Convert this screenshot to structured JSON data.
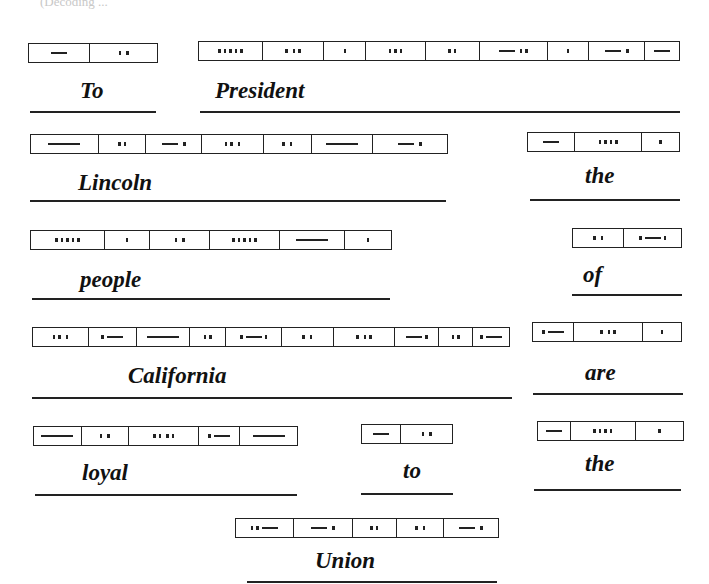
{
  "header_fragment": "(Decoding ...",
  "groups": [
    {
      "word": "To",
      "box": {
        "x": 28,
        "y": 43,
        "w": 130
      },
      "cells": [
        {
          "w": 62,
          "code": "L"
        },
        {
          "w": 68,
          "code": "d d"
        }
      ],
      "label": {
        "x": 80,
        "y": 78
      },
      "rule": {
        "x": 30,
        "y": 111,
        "w": 126
      }
    },
    {
      "word": "President",
      "box": {
        "x": 198,
        "y": 41,
        "w": 482
      },
      "cells": [
        {
          "w": 64,
          "code": "ddddd"
        },
        {
          "w": 62,
          "code": "d dd"
        },
        {
          "w": 42,
          "code": "d"
        },
        {
          "w": 60,
          "code": "ddd"
        },
        {
          "w": 54,
          "code": "dd"
        },
        {
          "w": 68,
          "code": "L dd"
        },
        {
          "w": 42,
          "code": "d"
        },
        {
          "w": 56,
          "code": "L d"
        },
        {
          "w": 34,
          "code": "L"
        }
      ],
      "label": {
        "x": 215,
        "y": 78
      },
      "rule": {
        "x": 200,
        "y": 111,
        "w": 480
      }
    },
    {
      "word": "Lincoln",
      "box": {
        "x": 30,
        "y": 134,
        "w": 418
      },
      "cells": [
        {
          "w": 68,
          "code": "LL"
        },
        {
          "w": 48,
          "code": "dd"
        },
        {
          "w": 56,
          "code": "L d"
        },
        {
          "w": 62,
          "code": "dd d"
        },
        {
          "w": 48,
          "code": "d d"
        },
        {
          "w": 62,
          "code": "LL"
        },
        {
          "w": 74,
          "code": "L d"
        }
      ],
      "label": {
        "x": 78,
        "y": 170
      },
      "rule": {
        "x": 30,
        "y": 200,
        "w": 416
      }
    },
    {
      "word": "the",
      "box": {
        "x": 527,
        "y": 132,
        "w": 153
      },
      "cells": [
        {
          "w": 48,
          "code": "L"
        },
        {
          "w": 68,
          "code": "dddd"
        },
        {
          "w": 37,
          "code": "d"
        }
      ],
      "label": {
        "x": 585,
        "y": 163
      },
      "rule": {
        "x": 530,
        "y": 199,
        "w": 150
      }
    },
    {
      "word": "people",
      "box": {
        "x": 30,
        "y": 230,
        "w": 362
      },
      "cells": [
        {
          "w": 74,
          "code": "ddddd"
        },
        {
          "w": 46,
          "code": "d"
        },
        {
          "w": 60,
          "code": "d d"
        },
        {
          "w": 70,
          "code": "ddddd"
        },
        {
          "w": 66,
          "code": "LL"
        },
        {
          "w": 46,
          "code": "d"
        }
      ],
      "label": {
        "x": 80,
        "y": 267
      },
      "rule": {
        "x": 32,
        "y": 298,
        "w": 358
      }
    },
    {
      "word": "of",
      "box": {
        "x": 572,
        "y": 228,
        "w": 110
      },
      "cells": [
        {
          "w": 52,
          "code": "d d"
        },
        {
          "w": 58,
          "code": "dLd"
        }
      ],
      "label": {
        "x": 583,
        "y": 262
      },
      "rule": {
        "x": 572,
        "y": 294,
        "w": 110
      }
    },
    {
      "word": "California",
      "box": {
        "x": 32,
        "y": 327,
        "w": 478
      },
      "cells": [
        {
          "w": 56,
          "code": "dd d"
        },
        {
          "w": 48,
          "code": "dL"
        },
        {
          "w": 54,
          "code": "LL"
        },
        {
          "w": 36,
          "code": "dd"
        },
        {
          "w": 56,
          "code": "dLd"
        },
        {
          "w": 52,
          "code": "d d"
        },
        {
          "w": 62,
          "code": "d dd"
        },
        {
          "w": 44,
          "code": "Ld"
        },
        {
          "w": 34,
          "code": "dd"
        },
        {
          "w": 36,
          "code": "dL"
        }
      ],
      "label": {
        "x": 128,
        "y": 363
      },
      "rule": {
        "x": 32,
        "y": 397,
        "w": 480
      }
    },
    {
      "word": "are",
      "box": {
        "x": 532,
        "y": 322,
        "w": 150
      },
      "cells": [
        {
          "w": 42,
          "code": "dL"
        },
        {
          "w": 69,
          "code": "d dd"
        },
        {
          "w": 39,
          "code": "d"
        }
      ],
      "label": {
        "x": 585,
        "y": 360
      },
      "rule": {
        "x": 533,
        "y": 393,
        "w": 150
      }
    },
    {
      "word": "loyal",
      "box": {
        "x": 33,
        "y": 426,
        "w": 265
      },
      "cells": [
        {
          "w": 48,
          "code": "LL"
        },
        {
          "w": 48,
          "code": "d d"
        },
        {
          "w": 70,
          "code": "dd dd"
        },
        {
          "w": 42,
          "code": "dL"
        },
        {
          "w": 57,
          "code": "LL"
        }
      ],
      "label": {
        "x": 82,
        "y": 460
      },
      "rule": {
        "x": 35,
        "y": 494,
        "w": 262
      }
    },
    {
      "word": "to",
      "box": {
        "x": 361,
        "y": 424,
        "w": 92
      },
      "cells": [
        {
          "w": 40,
          "code": "L"
        },
        {
          "w": 52,
          "code": "d d"
        }
      ],
      "label": {
        "x": 403,
        "y": 458
      },
      "rule": {
        "x": 361,
        "y": 493,
        "w": 92
      }
    },
    {
      "word": "the",
      "box": {
        "x": 537,
        "y": 421,
        "w": 147
      },
      "cells": [
        {
          "w": 33,
          "code": "L"
        },
        {
          "w": 66,
          "code": "dddd"
        },
        {
          "w": 48,
          "code": "d"
        }
      ],
      "label": {
        "x": 585,
        "y": 451
      },
      "rule": {
        "x": 534,
        "y": 489,
        "w": 147
      }
    },
    {
      "word": "Union",
      "box": {
        "x": 235,
        "y": 518,
        "w": 264
      },
      "cells": [
        {
          "w": 58,
          "code": "ddL"
        },
        {
          "w": 60,
          "code": "L d"
        },
        {
          "w": 44,
          "code": "dd"
        },
        {
          "w": 48,
          "code": "d d"
        },
        {
          "w": 54,
          "code": "L d"
        }
      ],
      "label": {
        "x": 315,
        "y": 548
      },
      "rule": {
        "x": 247,
        "y": 581,
        "w": 250
      }
    }
  ]
}
